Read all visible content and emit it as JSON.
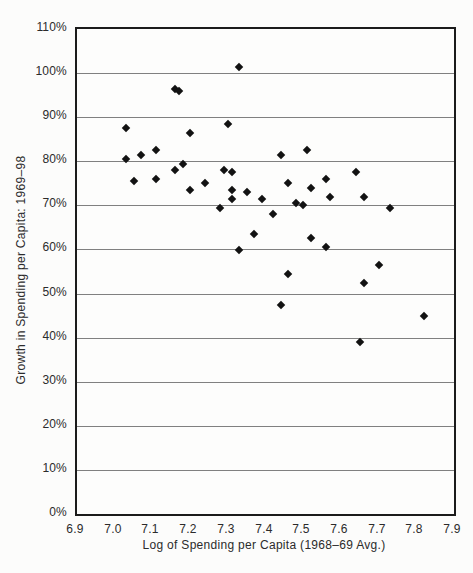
{
  "page": {
    "background": "#fcfcfb"
  },
  "chart_data": {
    "type": "scatter",
    "title": "",
    "xlabel": "Log of Spending per Capita (1968–69 Avg.)",
    "ylabel": "Growth in Spending per Capita: 1969–98",
    "x_axis": {
      "min": 6.9,
      "max": 7.9,
      "tick_labels": [
        "6.9",
        "7.0",
        "7.1",
        "7.2",
        "7.3",
        "7.4",
        "7.5",
        "7.6",
        "7.7",
        "7.8",
        "7.9"
      ]
    },
    "y_axis": {
      "min_pct": 0,
      "max_pct": 110,
      "tick_labels": [
        "0%",
        "10%",
        "20%",
        "30%",
        "40%",
        "50%",
        "60%",
        "70%",
        "80%",
        "90%",
        "100%",
        "110%"
      ]
    },
    "grid": {
      "horizontal": true,
      "vertical": false,
      "color": "#808080"
    },
    "marker": {
      "shape": "diamond",
      "color": "#121212",
      "size_px": 8
    },
    "frame_color": "#1b1b1b",
    "legend": "none",
    "points": [
      [
        7.03,
        87.5
      ],
      [
        7.03,
        80.5
      ],
      [
        7.05,
        75.5
      ],
      [
        7.07,
        81.5
      ],
      [
        7.11,
        82.5
      ],
      [
        7.11,
        76
      ],
      [
        7.16,
        96.5
      ],
      [
        7.17,
        96
      ],
      [
        7.16,
        78
      ],
      [
        7.18,
        79.5
      ],
      [
        7.2,
        86.5
      ],
      [
        7.2,
        73.5
      ],
      [
        7.24,
        75
      ],
      [
        7.28,
        69.5
      ],
      [
        7.29,
        78
      ],
      [
        7.3,
        88.5
      ],
      [
        7.31,
        77.5
      ],
      [
        7.31,
        73.5
      ],
      [
        7.31,
        71.5
      ],
      [
        7.33,
        101.5
      ],
      [
        7.33,
        60
      ],
      [
        7.35,
        73
      ],
      [
        7.37,
        63.5
      ],
      [
        7.39,
        71.5
      ],
      [
        7.42,
        68
      ],
      [
        7.44,
        81.5
      ],
      [
        7.44,
        47.5
      ],
      [
        7.46,
        75
      ],
      [
        7.46,
        54.5
      ],
      [
        7.48,
        70.5
      ],
      [
        7.5,
        70
      ],
      [
        7.51,
        82.5
      ],
      [
        7.52,
        74
      ],
      [
        7.52,
        62.5
      ],
      [
        7.56,
        76
      ],
      [
        7.56,
        60.5
      ],
      [
        7.57,
        72
      ],
      [
        7.64,
        77.5
      ],
      [
        7.65,
        39
      ],
      [
        7.66,
        72
      ],
      [
        7.66,
        52.5
      ],
      [
        7.7,
        56.5
      ],
      [
        7.73,
        69.5
      ],
      [
        7.82,
        45
      ]
    ]
  }
}
